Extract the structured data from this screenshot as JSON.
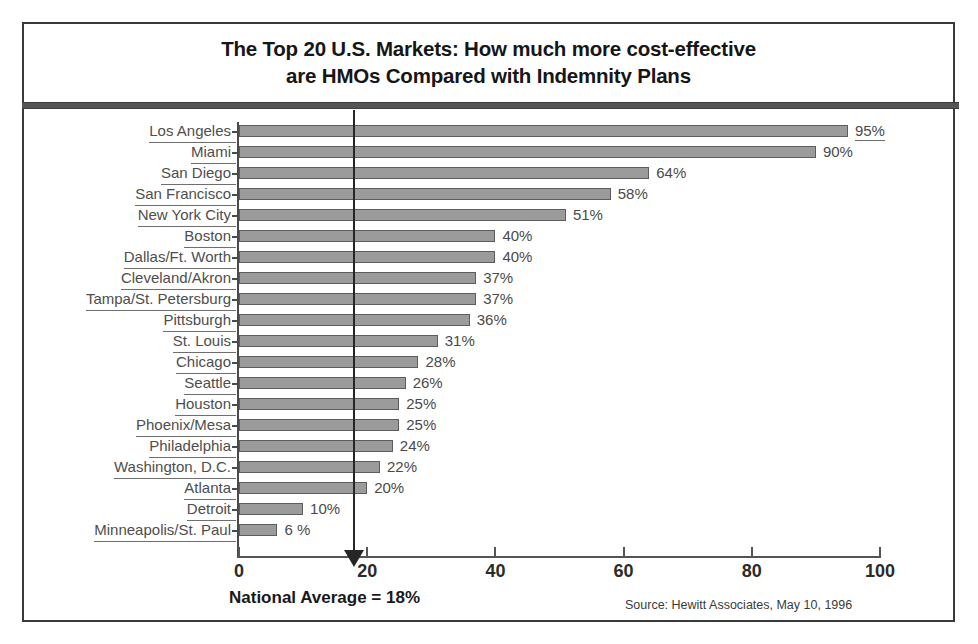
{
  "chart_data": {
    "type": "bar",
    "orientation": "horizontal",
    "title": "The Top 20 U.S. Markets: How much more cost-effective\nare HMOs Compared with Indemnity Plans",
    "xlabel": "",
    "ylabel": "",
    "xlim": [
      0,
      100
    ],
    "xticks": [
      "0",
      "20",
      "40",
      "60",
      "80",
      "100"
    ],
    "xtick_values": [
      0,
      20,
      40,
      60,
      80,
      100
    ],
    "grid": false,
    "legend": "none",
    "categories": [
      "Los Angeles",
      "Miami",
      "San Diego",
      "San Francisco",
      "New York City",
      "Boston",
      "Dallas/Ft. Worth",
      "Cleveland/Akron",
      "Tampa/St. Petersburg",
      "Pittsburgh",
      "St. Louis",
      "Chicago",
      "Seattle",
      "Houston",
      "Phoenix/Mesa",
      "Philadelphia",
      "Washington, D.C.",
      "Atlanta",
      "Detroit",
      "Minneapolis/St. Paul"
    ],
    "values": [
      95,
      90,
      64,
      58,
      51,
      40,
      40,
      37,
      37,
      36,
      31,
      28,
      26,
      25,
      25,
      24,
      22,
      20,
      10,
      6
    ],
    "value_labels": [
      "95%",
      "90%",
      "64%",
      "58%",
      "51%",
      "40%",
      "40%",
      "37%",
      "37%",
      "36%",
      "31%",
      "28%",
      "26%",
      "25%",
      "25%",
      "24%",
      "22%",
      "20%",
      "10%",
      "6 %"
    ],
    "annotations": [
      {
        "name": "national-average",
        "label": "National Average = 18%",
        "value": 18
      }
    ],
    "source": "Source:  Hewitt Associates, May 10, 1996",
    "colors": {
      "bar_fill": "#9b9b9b",
      "bar_edge": "#5d5d5d",
      "axis": "#555555",
      "text": "#4a4a4a",
      "title_text": "#161616",
      "divider": "#555555",
      "frame": "#3a3a3a",
      "annotation_line": "#262626"
    }
  }
}
